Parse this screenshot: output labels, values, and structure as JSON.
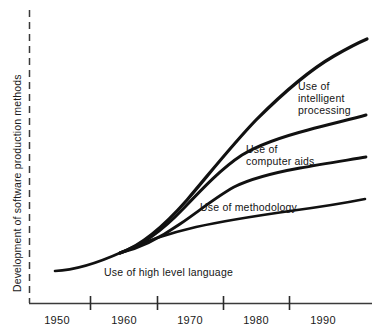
{
  "chart_data": {
    "type": "line",
    "title": "",
    "subtitle": "",
    "xlabel": "",
    "ylabel": "Development of software production methods",
    "xlim": [
      1945,
      1996
    ],
    "ylim": [
      0,
      100
    ],
    "grid": false,
    "legend_position": "inline-annotations",
    "x_tick_labels": [
      "1950",
      "1960",
      "1970",
      "1980",
      "1990"
    ],
    "x_tick_values": [
      1950,
      1960,
      1970,
      1980,
      1990
    ],
    "x_tick_marks_at": [
      1955,
      1965,
      1975,
      1985
    ],
    "y_axis_style": "dashed-unlabeled",
    "y_tick_labels": [],
    "annotations": [
      "Use of high level language",
      "Use of methodology",
      "Use of computer aids",
      "Use of intelligent processing"
    ],
    "series": [
      {
        "name": "Use of high level language",
        "label_lines": [
          "Use of high level language"
        ],
        "x": [
          1948,
          1952,
          1956,
          1960,
          1964,
          1968,
          1972,
          1976,
          1980,
          1984,
          1988,
          1992,
          1995
        ],
        "values": [
          7,
          8,
          10,
          13,
          17,
          22,
          27,
          31,
          34,
          37,
          40,
          44,
          48
        ],
        "curve_path": "M 55 271 C 78 270 100 262 122 252 C 145 241 170 233 196 227 C 228 220 262 215 290 211 C 320 207 345 203 365 199"
      },
      {
        "name": "Use of methodology",
        "label_lines": [
          "Use of methodology"
        ],
        "x": [
          1959,
          1963,
          1967,
          1971,
          1975,
          1979,
          1983,
          1987,
          1991,
          1995
        ],
        "values": [
          14,
          22,
          32,
          44,
          55,
          61,
          64,
          67,
          70,
          73
        ],
        "curve_path": "M 120 253 C 140 248 160 238 180 224 C 199 211 216 197 234 187 C 254 177 278 172 300 168 C 322 164 348 160 366 157"
      },
      {
        "name": "Use of computer aids",
        "label_lines": [
          "Use of",
          "computer aids"
        ],
        "x": [
          1959,
          1963,
          1967,
          1971,
          1975,
          1979,
          1983,
          1987,
          1991,
          1995
        ],
        "values": [
          14,
          24,
          37,
          52,
          66,
          76,
          81,
          85,
          88,
          91
        ],
        "curve_path": "M 120 253 C 142 246 163 230 184 208 C 203 188 222 168 242 155 C 262 143 285 136 308 130 C 330 124 352 119 366 115"
      },
      {
        "name": "Use of intelligent processing",
        "label_lines": [
          "Use of",
          "intelligent",
          "processing"
        ],
        "x": [
          1959,
          1963,
          1967,
          1971,
          1975,
          1979,
          1983,
          1987,
          1991,
          1995
        ],
        "values": [
          14,
          25,
          40,
          58,
          74,
          84,
          90,
          94,
          97,
          100
        ],
        "curve_path": "M 120 253 C 143 245 165 225 187 200 C 210 173 232 145 256 120 C 280 96 308 71 334 56 C 348 48 360 42 367 39"
      }
    ]
  },
  "axis": {
    "y_title": "Development of software production methods"
  },
  "labels": {
    "high_level_language": "Use of high level language",
    "methodology": "Use of methodology",
    "computer_aids_line1": "Use of",
    "computer_aids_line2": "computer aids",
    "intelligent_line1": "Use of",
    "intelligent_line2": "intelligent",
    "intelligent_line3": "processing"
  },
  "ticks": {
    "t1950": "1950",
    "t1960": "1960",
    "t1970": "1970",
    "t1980": "1980",
    "t1990": "1990"
  },
  "colors": {
    "curve": "#111111",
    "axis": "#3a3a3a",
    "text": "#1a1a1a",
    "background": "#ffffff"
  }
}
